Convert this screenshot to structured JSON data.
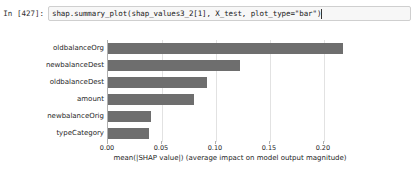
{
  "notebook": {
    "prompt": "In [427]:",
    "code": "shap.summary_plot(shap_values3_2[1], X_test, plot_type=\"bar\")"
  },
  "colors": {
    "bar": "#6e6e6e",
    "grid": "#e2e2e2",
    "axis": "#b0b0b0",
    "cell_background": "#f7f7f7",
    "cell_border": "#cfcfcf"
  },
  "chart_data": {
    "type": "bar",
    "orientation": "horizontal",
    "title": "",
    "xlabel": "mean(|SHAP value|) (average impact on model output magnitude)",
    "ylabel": "",
    "categories": [
      "oldbalanceOrg",
      "newbalanceDest",
      "oldbalanceDest",
      "amount",
      "newbalanceOrig",
      "typeCategory"
    ],
    "values": [
      0.218,
      0.122,
      0.092,
      0.08,
      0.04,
      0.038
    ],
    "xticks": [
      0.0,
      0.05,
      0.1,
      0.15,
      0.2
    ],
    "xticklabels": [
      "0.00",
      "0.05",
      "0.10",
      "0.15",
      "0.20"
    ],
    "xlim": [
      0.0,
      0.2325
    ],
    "grid": true,
    "legend": null
  }
}
